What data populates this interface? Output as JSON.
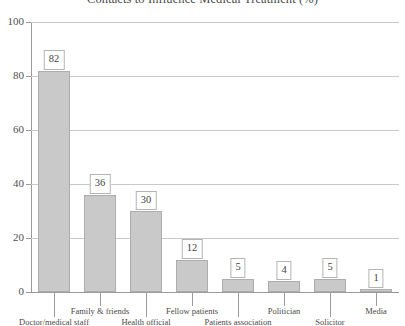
{
  "chart_data": {
    "type": "bar",
    "title": "Contacts to Influence Medical Treatment (%)",
    "xlabel": "",
    "ylabel": "",
    "ylim": [
      0,
      100
    ],
    "yticks": [
      0,
      20,
      40,
      60,
      80,
      100
    ],
    "grid": true,
    "legend": false,
    "categories": [
      "Doctor/medical staff",
      "Family & friends",
      "Health official",
      "Fellow patients",
      "Patients association",
      "Politician",
      "Solicitor",
      "Media"
    ],
    "values": [
      82,
      36,
      30,
      12,
      5,
      4,
      5,
      1
    ],
    "value_labels": [
      "82",
      "36",
      "30",
      "12",
      "5",
      "4",
      "5",
      "1"
    ],
    "colors": {
      "bar_fill": "#c9c9c9",
      "bar_border": "#adadad",
      "gridline": "#c9c9c9",
      "axis": "#9a9a9a",
      "text": "#4a4a4a",
      "background": "#ffffff"
    }
  },
  "axis": {
    "y_tick_labels": [
      "100",
      "80",
      "60",
      "40",
      "20",
      "0"
    ]
  }
}
